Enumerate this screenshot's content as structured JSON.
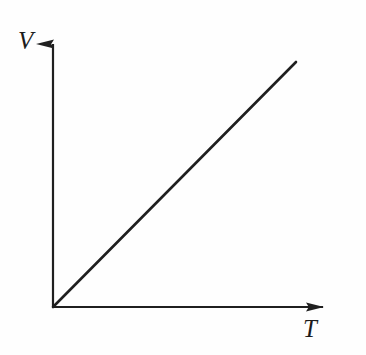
{
  "figure": {
    "kind": "line-graph",
    "background_color": "#fefefe",
    "ink_color": "#1f1f1f",
    "y_axis_label": "V",
    "x_axis_label": "T",
    "y_axis_icon": "arrow-up-icon",
    "x_axis_icon": "arrow-right-icon"
  },
  "chart_data": {
    "type": "line",
    "title": "",
    "subtitle": "",
    "xlabel": "T",
    "ylabel": "V",
    "grid": false,
    "legend": null,
    "axis_arrows": true,
    "tick_labels": {
      "x": [],
      "y": []
    },
    "xlim": [
      0,
      1.18
    ],
    "ylim": [
      0,
      1.18
    ],
    "annotations": [],
    "series": [
      {
        "name": "V proportional to T",
        "x": [
          0,
          1
        ],
        "y": [
          0,
          1
        ],
        "style": "solid",
        "color": "#1f1f1f",
        "width_px": 2.6,
        "description": "straight line through the origin with constant positive slope"
      }
    ],
    "relationship": "V = k T (direct proportionality, line passes through origin)"
  },
  "geometry": {
    "origin": {
      "x": 53,
      "y": 307
    },
    "y_axis_tip": {
      "x": 53,
      "y": 27
    },
    "x_axis_tip": {
      "x": 340,
      "y": 307
    },
    "line_end": {
      "x": 296,
      "y": 62
    },
    "axis_stroke_px": 2.2,
    "arrow_head_length_px": 17,
    "arrow_head_width_px": 9
  }
}
